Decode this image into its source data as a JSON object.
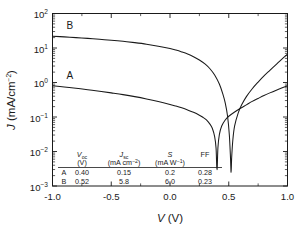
{
  "chart_data": {
    "type": "line",
    "title": "",
    "xlabel": "V (V)",
    "ylabel": "J (mA/cm⁻²)",
    "xlim": [
      -1.0,
      1.0
    ],
    "ylim": [
      0.001,
      100
    ],
    "yscale": "log",
    "grid": false,
    "legend_position": "inline-curve-labels",
    "xticks": [
      "-1.0",
      "-0.5",
      "0.0",
      "0.5",
      "1.0"
    ],
    "xtick_values": [
      -1.0,
      -0.5,
      0.0,
      0.5,
      1.0
    ],
    "ytick_labels": [
      "10²",
      "10¹",
      "10⁰",
      "10⁻¹",
      "10⁻²",
      "10⁻³"
    ],
    "ytick_values": [
      100,
      10,
      1,
      0.1,
      0.01,
      0.001
    ],
    "series": [
      {
        "name": "A",
        "label_position": {
          "x": -0.88,
          "y": 1.6
        },
        "voc": 0.4,
        "points": [
          [
            -1.0,
            0.8
          ],
          [
            -0.9,
            0.74
          ],
          [
            -0.8,
            0.68
          ],
          [
            -0.7,
            0.62
          ],
          [
            -0.6,
            0.56
          ],
          [
            -0.5,
            0.5
          ],
          [
            -0.4,
            0.445
          ],
          [
            -0.3,
            0.39
          ],
          [
            -0.2,
            0.335
          ],
          [
            -0.1,
            0.282
          ],
          [
            0.0,
            0.232
          ],
          [
            0.05,
            0.208
          ],
          [
            0.1,
            0.184
          ],
          [
            0.15,
            0.16
          ],
          [
            0.2,
            0.137
          ],
          [
            0.25,
            0.113
          ],
          [
            0.28,
            0.098
          ],
          [
            0.31,
            0.082
          ],
          [
            0.34,
            0.062
          ],
          [
            0.36,
            0.047
          ],
          [
            0.38,
            0.027
          ],
          [
            0.392,
            0.0125
          ],
          [
            0.398,
            0.0035
          ],
          [
            0.4,
            0.0009
          ],
          [
            0.402,
            0.0035
          ],
          [
            0.408,
            0.013
          ],
          [
            0.42,
            0.031
          ],
          [
            0.44,
            0.055
          ],
          [
            0.47,
            0.082
          ],
          [
            0.5,
            0.105
          ],
          [
            0.55,
            0.14
          ],
          [
            0.6,
            0.18
          ],
          [
            0.65,
            0.225
          ],
          [
            0.7,
            0.283
          ],
          [
            0.75,
            0.345
          ],
          [
            0.8,
            0.42
          ],
          [
            0.85,
            0.5
          ],
          [
            0.9,
            0.59
          ],
          [
            0.95,
            0.69
          ],
          [
            1.0,
            0.8
          ]
        ]
      },
      {
        "name": "B",
        "label_position": {
          "x": -0.88,
          "y": 46
        },
        "voc": 0.52,
        "points": [
          [
            -1.0,
            22.0
          ],
          [
            -0.9,
            21.0
          ],
          [
            -0.8,
            20.0
          ],
          [
            -0.7,
            19.0
          ],
          [
            -0.6,
            17.9
          ],
          [
            -0.5,
            16.8
          ],
          [
            -0.4,
            15.6
          ],
          [
            -0.3,
            14.3
          ],
          [
            -0.2,
            12.9
          ],
          [
            -0.1,
            11.3
          ],
          [
            0.0,
            9.6
          ],
          [
            0.05,
            8.7
          ],
          [
            0.1,
            7.7
          ],
          [
            0.15,
            6.7
          ],
          [
            0.2,
            5.6
          ],
          [
            0.25,
            4.5
          ],
          [
            0.3,
            3.4
          ],
          [
            0.34,
            2.5
          ],
          [
            0.38,
            1.65
          ],
          [
            0.42,
            0.9
          ],
          [
            0.45,
            0.46
          ],
          [
            0.47,
            0.255
          ],
          [
            0.49,
            0.105
          ],
          [
            0.505,
            0.03
          ],
          [
            0.515,
            0.0065
          ],
          [
            0.52,
            0.0025
          ],
          [
            0.525,
            0.0068
          ],
          [
            0.535,
            0.022
          ],
          [
            0.55,
            0.055
          ],
          [
            0.58,
            0.13
          ],
          [
            0.61,
            0.225
          ],
          [
            0.65,
            0.39
          ],
          [
            0.7,
            0.66
          ],
          [
            0.75,
            1.03
          ],
          [
            0.8,
            1.55
          ],
          [
            0.85,
            2.25
          ],
          [
            0.9,
            3.25
          ],
          [
            0.95,
            4.7
          ],
          [
            1.0,
            6.6
          ]
        ]
      }
    ],
    "inline_table": {
      "headers": [
        {
          "symbol": "V",
          "sub": "oc",
          "units": "(V)"
        },
        {
          "symbol": "J",
          "sub": "sc",
          "units": "(mA cm⁻²)"
        },
        {
          "symbol": "S",
          "sub": "",
          "units": "(mA W⁻¹)"
        },
        {
          "symbol": "FF",
          "sub": "",
          "units": ""
        }
      ],
      "rows": [
        {
          "name": "A",
          "voc": "0.40",
          "jsc": "0.15",
          "s": "0.2",
          "ff": "0.28"
        },
        {
          "name": "B",
          "voc": "0.52",
          "jsc": "5.8",
          "s": "6.0",
          "ff": "0.23"
        }
      ]
    },
    "colors": {
      "curve": "#1a1a1a",
      "axis": "#1a1a1a",
      "background": "#ffffff"
    }
  }
}
